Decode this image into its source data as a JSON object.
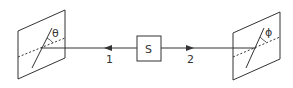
{
  "diagram": {
    "type": "polarization-correlation-setup",
    "source": {
      "label": "S"
    },
    "beams": [
      {
        "label": "1",
        "direction": "left"
      },
      {
        "label": "2",
        "direction": "right"
      }
    ],
    "polarizers": [
      {
        "side": "left",
        "angle_label": "θ"
      },
      {
        "side": "right",
        "angle_label": "ϕ"
      }
    ],
    "colors": {
      "stroke": "#333333",
      "background": "#ffffff"
    }
  }
}
